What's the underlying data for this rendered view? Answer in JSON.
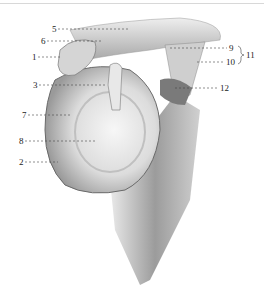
{
  "figure": {
    "labels": [
      {
        "id": "5",
        "text": "5",
        "x": 52,
        "y": 25
      },
      {
        "id": "6",
        "text": "6",
        "x": 41,
        "y": 37
      },
      {
        "id": "1",
        "text": "1",
        "x": 32,
        "y": 53
      },
      {
        "id": "9",
        "text": "9",
        "x": 229,
        "y": 44
      },
      {
        "id": "11",
        "text": "11",
        "x": 244,
        "y": 51
      },
      {
        "id": "10",
        "text": "10",
        "x": 226,
        "y": 58
      },
      {
        "id": "3",
        "text": "3",
        "x": 33,
        "y": 81
      },
      {
        "id": "12",
        "text": "12",
        "x": 220,
        "y": 84
      },
      {
        "id": "7",
        "text": "7",
        "x": 22,
        "y": 111
      },
      {
        "id": "8",
        "text": "8",
        "x": 19,
        "y": 137
      },
      {
        "id": "2",
        "text": "2",
        "x": 19,
        "y": 158
      }
    ]
  }
}
